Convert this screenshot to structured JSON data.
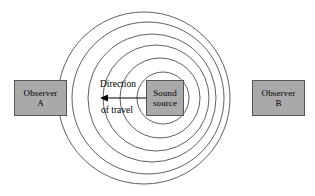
{
  "figure": {
    "width": 315,
    "height": 196,
    "background_color": "#ffffff"
  },
  "colors": {
    "box_fill": "#a9a9a9",
    "box_border": "#555555",
    "wave_stroke": "#4d4d4d",
    "arrow_color": "#000000",
    "text_color": "#000000"
  },
  "observer_a": {
    "line1": "Observer",
    "line2": "A"
  },
  "observer_b": {
    "line1": "Observer",
    "line2": "B"
  },
  "sound_source": {
    "line1": "Sound",
    "line2": "source"
  },
  "direction_annotation": {
    "line1": "Direction",
    "line2": "of travel",
    "arrow_points": "left"
  },
  "chart_data": {
    "type": "scatter",
    "xlabel": "",
    "ylabel": "",
    "xlim": [
      0,
      315
    ],
    "ylim": [
      0,
      196
    ],
    "grid": false,
    "legend_position": "none",
    "wavefronts": [
      {
        "index": 1,
        "cx": 163,
        "cy": 98,
        "r": 26
      },
      {
        "index": 2,
        "cx": 160,
        "cy": 98,
        "r": 40
      },
      {
        "index": 3,
        "cx": 156,
        "cy": 98,
        "r": 53
      },
      {
        "index": 4,
        "cx": 152,
        "cy": 98,
        "r": 64
      },
      {
        "index": 5,
        "cx": 148,
        "cy": 98,
        "r": 76
      },
      {
        "index": 6,
        "cx": 144,
        "cy": 98,
        "r": 86
      }
    ],
    "arrow": {
      "x_tail": 146,
      "x_head": 100,
      "y": 98
    },
    "boxes": [
      {
        "name": "Observer A",
        "x": 14,
        "y": 80,
        "w": 53,
        "h": 36
      },
      {
        "name": "Sound source",
        "x": 146,
        "y": 80,
        "w": 38,
        "h": 36
      },
      {
        "name": "Observer B",
        "x": 252,
        "y": 80,
        "w": 53,
        "h": 36
      }
    ]
  }
}
